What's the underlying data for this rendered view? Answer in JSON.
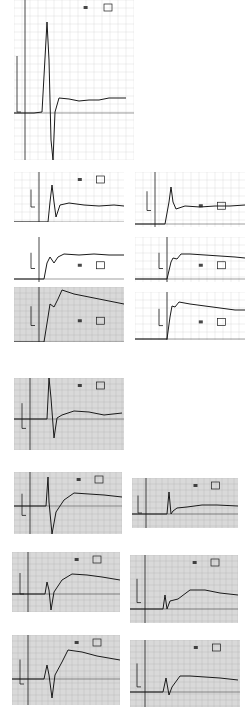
{
  "figure": {
    "background": "#ffffff",
    "ink": "#1a1a1a",
    "grid_color": "#b8b8b8",
    "shade_color": "#d9d9d9"
  },
  "chart_data": [
    {
      "id": "p1",
      "type": "line",
      "box": [
        14,
        0,
        120,
        160
      ],
      "grid": "light",
      "axis_x": 11,
      "baseline": 113,
      "shaded": false,
      "tag": "box",
      "points": [
        [
          0,
          113
        ],
        [
          20,
          113
        ],
        [
          28,
          112
        ],
        [
          31,
          58
        ],
        [
          33,
          22
        ],
        [
          35,
          60
        ],
        [
          37,
          140
        ],
        [
          39,
          160
        ],
        [
          41,
          112
        ],
        [
          45,
          98
        ],
        [
          55,
          99
        ],
        [
          65,
          101
        ],
        [
          75,
          100
        ],
        [
          85,
          100
        ],
        [
          95,
          98
        ],
        [
          105,
          98
        ],
        [
          112,
          98
        ]
      ]
    },
    {
      "id": "p2",
      "type": "line",
      "box": [
        14,
        172,
        110,
        50
      ],
      "grid": "light",
      "axis_x": 25,
      "baseline": 50,
      "shaded": false,
      "points": [
        [
          0,
          50
        ],
        [
          34,
          50
        ],
        [
          36,
          30
        ],
        [
          38,
          13
        ],
        [
          40,
          30
        ],
        [
          42,
          45
        ],
        [
          46,
          33
        ],
        [
          55,
          31
        ],
        [
          70,
          33
        ],
        [
          85,
          34
        ],
        [
          100,
          33
        ],
        [
          110,
          34
        ]
      ]
    },
    {
      "id": "p3",
      "type": "line",
      "box": [
        135,
        172,
        110,
        55
      ],
      "grid": "light",
      "axis_x": 20,
      "baseline": 52,
      "shaded": false,
      "points": [
        [
          0,
          52
        ],
        [
          30,
          52
        ],
        [
          34,
          30
        ],
        [
          36,
          15
        ],
        [
          38,
          30
        ],
        [
          41,
          37
        ],
        [
          50,
          34
        ],
        [
          65,
          35
        ],
        [
          80,
          34
        ],
        [
          95,
          34
        ],
        [
          110,
          33
        ]
      ]
    },
    {
      "id": "p4",
      "type": "line",
      "box": [
        14,
        237,
        110,
        45
      ],
      "grid": "none",
      "axis_x": 25,
      "baseline": 42,
      "shaded": false,
      "points": [
        [
          0,
          42
        ],
        [
          30,
          42
        ],
        [
          33,
          26
        ],
        [
          36,
          20
        ],
        [
          40,
          26
        ],
        [
          44,
          20
        ],
        [
          50,
          17
        ],
        [
          65,
          18
        ],
        [
          80,
          17
        ],
        [
          95,
          18
        ],
        [
          110,
          18
        ]
      ]
    },
    {
      "id": "p5",
      "type": "line",
      "box": [
        135,
        237,
        110,
        45
      ],
      "grid": "light",
      "axis_x": 32,
      "baseline": 42,
      "shaded": false,
      "points": [
        [
          0,
          42
        ],
        [
          32,
          42
        ],
        [
          36,
          25
        ],
        [
          38,
          21
        ],
        [
          42,
          22
        ],
        [
          46,
          17
        ],
        [
          55,
          17
        ],
        [
          70,
          18
        ],
        [
          85,
          19
        ],
        [
          100,
          20
        ],
        [
          110,
          21
        ]
      ]
    },
    {
      "id": "p6",
      "type": "line",
      "box": [
        14,
        287,
        110,
        55
      ],
      "grid": "dense",
      "axis_x": 25,
      "baseline": 55,
      "shaded": true,
      "points": [
        [
          0,
          55
        ],
        [
          30,
          55
        ],
        [
          34,
          30
        ],
        [
          36,
          17
        ],
        [
          40,
          20
        ],
        [
          44,
          12
        ],
        [
          48,
          3
        ],
        [
          60,
          7
        ],
        [
          75,
          10
        ],
        [
          90,
          13
        ],
        [
          110,
          17
        ]
      ]
    },
    {
      "id": "p7",
      "type": "line",
      "box": [
        135,
        292,
        110,
        48
      ],
      "grid": "light",
      "axis_x": 32,
      "baseline": 47,
      "shaded": false,
      "points": [
        [
          0,
          47
        ],
        [
          32,
          47
        ],
        [
          35,
          25
        ],
        [
          37,
          14
        ],
        [
          40,
          15
        ],
        [
          44,
          10
        ],
        [
          55,
          12
        ],
        [
          70,
          14
        ],
        [
          85,
          16
        ],
        [
          100,
          18
        ],
        [
          110,
          18
        ]
      ]
    },
    {
      "id": "p8",
      "type": "line",
      "box": [
        14,
        378,
        110,
        72
      ],
      "grid": "dense",
      "axis_x": 16,
      "baseline": 41,
      "shaded": true,
      "tag": "box",
      "points": [
        [
          0,
          41
        ],
        [
          33,
          41
        ],
        [
          35,
          0
        ],
        [
          37,
          20
        ],
        [
          40,
          60
        ],
        [
          43,
          40
        ],
        [
          48,
          37
        ],
        [
          60,
          33
        ],
        [
          75,
          34
        ],
        [
          90,
          37
        ],
        [
          108,
          35
        ]
      ]
    },
    {
      "id": "p9",
      "type": "line",
      "box": [
        14,
        472,
        108,
        62
      ],
      "grid": "dense",
      "axis_x": 16,
      "baseline": 34,
      "shaded": true,
      "tag": "box",
      "points": [
        [
          0,
          34
        ],
        [
          32,
          34
        ],
        [
          34,
          5
        ],
        [
          35,
          30
        ],
        [
          38,
          62
        ],
        [
          42,
          40
        ],
        [
          50,
          28
        ],
        [
          60,
          21
        ],
        [
          75,
          22
        ],
        [
          90,
          23
        ],
        [
          108,
          25
        ]
      ]
    },
    {
      "id": "p10",
      "type": "line",
      "box": [
        132,
        478,
        106,
        50
      ],
      "grid": "dense",
      "axis_x": 14,
      "baseline": 36,
      "shaded": true,
      "tag": "box",
      "points": [
        [
          0,
          36
        ],
        [
          35,
          36
        ],
        [
          37,
          14
        ],
        [
          39,
          36
        ],
        [
          41,
          33
        ],
        [
          45,
          30
        ],
        [
          55,
          29
        ],
        [
          70,
          27
        ],
        [
          85,
          27
        ],
        [
          106,
          28
        ]
      ]
    },
    {
      "id": "p11",
      "type": "line",
      "box": [
        12,
        552,
        108,
        60
      ],
      "grid": "dense",
      "axis_x": 16,
      "baseline": 42,
      "shaded": true,
      "tag": "box",
      "points": [
        [
          0,
          42
        ],
        [
          33,
          42
        ],
        [
          35,
          30
        ],
        [
          37,
          38
        ],
        [
          39,
          58
        ],
        [
          42,
          40
        ],
        [
          50,
          28
        ],
        [
          60,
          22
        ],
        [
          75,
          23
        ],
        [
          90,
          25
        ],
        [
          108,
          28
        ]
      ]
    },
    {
      "id": "p12",
      "type": "line",
      "box": [
        130,
        555,
        108,
        68
      ],
      "grid": "dense",
      "axis_x": 15,
      "baseline": 54,
      "shaded": true,
      "tag": "box",
      "points": [
        [
          0,
          54
        ],
        [
          33,
          54
        ],
        [
          35,
          40
        ],
        [
          37,
          54
        ],
        [
          40,
          46
        ],
        [
          48,
          44
        ],
        [
          60,
          35
        ],
        [
          75,
          35
        ],
        [
          90,
          38
        ],
        [
          108,
          40
        ]
      ]
    },
    {
      "id": "p13",
      "type": "line",
      "box": [
        12,
        635,
        108,
        70
      ],
      "grid": "dense",
      "axis_x": 16,
      "baseline": 44,
      "shaded": true,
      "tag": "box",
      "points": [
        [
          0,
          44
        ],
        [
          32,
          44
        ],
        [
          35,
          30
        ],
        [
          37,
          40
        ],
        [
          40,
          63
        ],
        [
          43,
          40
        ],
        [
          50,
          27
        ],
        [
          56,
          15
        ],
        [
          70,
          17
        ],
        [
          85,
          21
        ],
        [
          108,
          25
        ]
      ]
    },
    {
      "id": "p14",
      "type": "line",
      "box": [
        130,
        640,
        110,
        67
      ],
      "grid": "dense",
      "axis_x": 15,
      "baseline": 52,
      "shaded": true,
      "tag": "box",
      "points": [
        [
          0,
          52
        ],
        [
          33,
          52
        ],
        [
          36,
          38
        ],
        [
          39,
          55
        ],
        [
          42,
          47
        ],
        [
          50,
          36
        ],
        [
          60,
          36
        ],
        [
          75,
          37
        ],
        [
          90,
          38
        ],
        [
          108,
          40
        ]
      ]
    }
  ]
}
